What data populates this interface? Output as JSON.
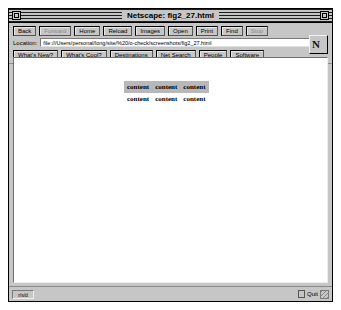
{
  "window": {
    "title": "Netscape: fig2_27.html",
    "close_icon": "close-box-icon",
    "resize_icon": "resize-box-icon"
  },
  "toolbar": {
    "buttons": [
      {
        "label": "Back",
        "name": "back-button",
        "disabled": false
      },
      {
        "label": "Forward",
        "name": "forward-button",
        "disabled": true
      },
      {
        "label": "Home",
        "name": "home-button",
        "disabled": false
      },
      {
        "label": "Reload",
        "name": "reload-button",
        "disabled": false
      },
      {
        "label": "Images",
        "name": "images-button",
        "disabled": false
      },
      {
        "label": "Open",
        "name": "open-button",
        "disabled": false
      },
      {
        "label": "Print",
        "name": "print-button",
        "disabled": false
      },
      {
        "label": "Find",
        "name": "find-button",
        "disabled": false
      },
      {
        "label": "Stop",
        "name": "stop-button",
        "disabled": true
      }
    ]
  },
  "location": {
    "label": "Location:",
    "value": "file:///Users/personal/long/site/%20/o-check/screenshots/fig2_27.html"
  },
  "directory": {
    "buttons": [
      {
        "label": "What's New?",
        "name": "whats-new-button"
      },
      {
        "label": "What's Cool?",
        "name": "whats-cool-button"
      },
      {
        "label": "Destinations",
        "name": "destinations-button"
      },
      {
        "label": "Net Search",
        "name": "net-search-button"
      },
      {
        "label": "People",
        "name": "people-button"
      },
      {
        "label": "Software",
        "name": "software-button"
      }
    ]
  },
  "page": {
    "table": {
      "rows": [
        {
          "shaded": true,
          "cells": [
            "content",
            "content",
            "content"
          ]
        },
        {
          "shaded": false,
          "cells": [
            "content",
            "content",
            "content"
          ]
        }
      ],
      "shaded_columns": [
        1
      ]
    }
  },
  "statusbar": {
    "left_label": "r/s/d",
    "right_label": "Quit"
  }
}
